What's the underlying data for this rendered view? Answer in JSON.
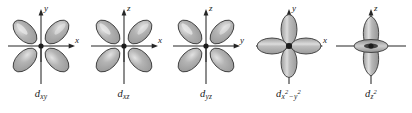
{
  "figure": {
    "background_color": "#ffffff",
    "outline_color": "#3a3a3a",
    "lobe_fill_color": "#a8a8a8",
    "lobe_highlight_color": "#d8d8d8",
    "axis_color": "#262626",
    "label_color": "#1a1a1a"
  },
  "orbitals": [
    {
      "name": "d-xy",
      "label_main": "d",
      "label_sub": "xy",
      "label_sup": "",
      "label_text": "d xy",
      "vertical_axis": "y",
      "horizontal_axis": "x",
      "lobe_orientation": "diagonal",
      "lobe_count": 4,
      "has_torus": false
    },
    {
      "name": "d-xz",
      "label_main": "d",
      "label_sub": "xz",
      "label_sup": "",
      "label_text": "d xz",
      "vertical_axis": "z",
      "horizontal_axis": "x",
      "lobe_orientation": "diagonal",
      "lobe_count": 4,
      "has_torus": false
    },
    {
      "name": "d-yz",
      "label_main": "d",
      "label_sub": "yz",
      "label_sup": "",
      "label_text": "d yz",
      "vertical_axis": "z",
      "horizontal_axis": "y",
      "lobe_orientation": "diagonal",
      "lobe_count": 4,
      "has_torus": false
    },
    {
      "name": "d-x2-y2",
      "label_main": "d",
      "label_sub": "x",
      "label_sup": "2",
      "label_op": "−",
      "label_sub2": "y",
      "label_sup2": "2",
      "label_text": "d x2 − y2",
      "vertical_axis": "y",
      "horizontal_axis": "x",
      "lobe_orientation": "axial",
      "lobe_count": 4,
      "has_torus": false
    },
    {
      "name": "d-z2",
      "label_main": "d",
      "label_sub": "z",
      "label_sup": "2",
      "label_text": "d z2",
      "vertical_axis": "z",
      "horizontal_axis": "",
      "lobe_orientation": "vertical",
      "lobe_count": 2,
      "has_torus": true
    }
  ]
}
